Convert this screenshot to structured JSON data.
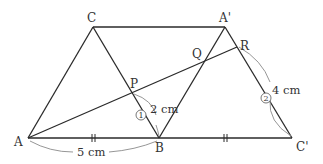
{
  "diagram": {
    "type": "geometry-figure",
    "colors": {
      "line": "#2a2a2a",
      "arc": "#8a8a8a",
      "text": "#333333"
    },
    "points": {
      "A": {
        "label": "A",
        "x": 28,
        "y": 138
      },
      "B": {
        "label": "B",
        "x": 159,
        "y": 138
      },
      "C_prime": {
        "label": "C'",
        "x": 292,
        "y": 138
      },
      "C": {
        "label": "C",
        "x": 93,
        "y": 27
      },
      "A_prime": {
        "label": "A'",
        "x": 225,
        "y": 27
      },
      "P": {
        "label": "P",
        "x": 133,
        "y": 93
      },
      "Q": {
        "label": "Q",
        "x": 205,
        "y": 61
      },
      "R": {
        "label": "R",
        "x": 237,
        "y": 47
      }
    },
    "measurements": {
      "AB": "5 cm",
      "PB": "2 cm",
      "RC_prime": "4 cm"
    },
    "markers": {
      "one": "①",
      "two": "②"
    }
  }
}
